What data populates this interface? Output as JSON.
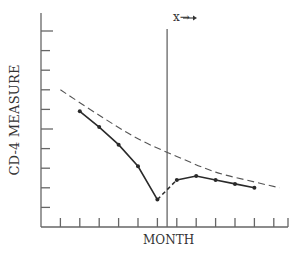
{
  "chart_data": {
    "type": "line",
    "title": "",
    "xlabel": "MONTH",
    "ylabel": "CD-4 MEASURE",
    "annotation": "x→",
    "annotation_x_tick": 6.5,
    "grid": false,
    "legend": null,
    "x_ticks": 12,
    "y_ticks": 10,
    "xlim": [
      0,
      12.5
    ],
    "ylim": [
      0,
      11
    ],
    "series": [
      {
        "name": "observed (pre-treatment)",
        "style": "solid",
        "x": [
          2,
          3,
          4,
          5,
          6
        ],
        "y": [
          5.9,
          5.1,
          4.2,
          3.1,
          1.4
        ]
      },
      {
        "name": "observed (post-treatment)",
        "style": "solid-dashed-start",
        "x": [
          6,
          7,
          8,
          9,
          10,
          11
        ],
        "y": [
          1.4,
          2.4,
          2.6,
          2.4,
          2.2,
          2.0
        ]
      },
      {
        "name": "expected decline",
        "style": "dashed",
        "x": [
          1,
          3,
          5,
          7,
          9,
          11,
          12.3
        ],
        "y": [
          7.0,
          5.7,
          4.5,
          3.6,
          2.8,
          2.3,
          2.0
        ]
      }
    ]
  },
  "labels": {
    "ylabel": "CD-4 MEASURE",
    "xlabel": "MONTH",
    "marker": "x→"
  },
  "colors": {
    "line": "#2a2a2a",
    "axis": "#555555",
    "dashed": "#555555"
  }
}
